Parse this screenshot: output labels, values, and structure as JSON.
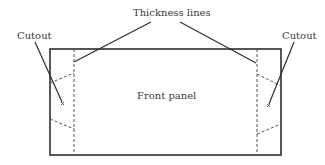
{
  "diagram": {
    "labels": {
      "thickness": "Thickness lines",
      "cutout_left": "Cutout",
      "cutout_right": "Cutout",
      "front_panel": "Front panel"
    },
    "colors": {
      "stroke": "#2e2e2e",
      "dashed": "#555555",
      "text": "#3a3a3a",
      "background": "#ffffff"
    },
    "panel": {
      "left": 50,
      "top": 49,
      "right": 281,
      "bottom": 155
    },
    "thickness_lines": {
      "left_x": 74,
      "right_x": 257
    },
    "cutout_marks": [
      "x",
      "x"
    ]
  }
}
